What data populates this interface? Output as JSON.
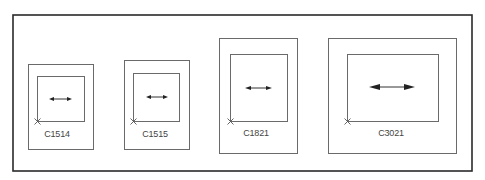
{
  "diagram": {
    "panels": [
      {
        "id": "C1514",
        "label": "C1514"
      },
      {
        "id": "C1515",
        "label": "C1515"
      },
      {
        "id": "C1821",
        "label": "C1821"
      },
      {
        "id": "C3021",
        "label": "C3021"
      }
    ]
  }
}
